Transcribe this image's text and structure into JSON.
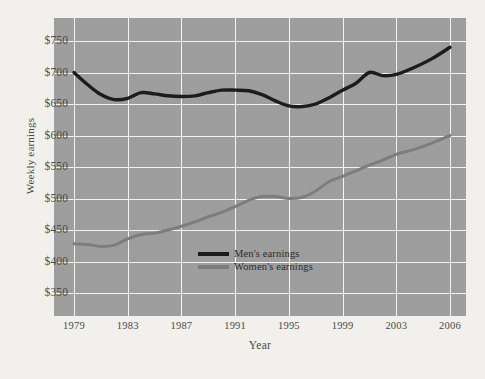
{
  "chart_data": {
    "type": "line",
    "title": "",
    "xlabel": "Year",
    "ylabel": "Weekly earnings",
    "xlim": [
      1979,
      2006
    ],
    "ylim": [
      350,
      750
    ],
    "ytick_labels": [
      "$750",
      "$700",
      "$650",
      "$600",
      "$550",
      "$500",
      "$450",
      "$400",
      "$350"
    ],
    "ytick_values": [
      750,
      700,
      650,
      600,
      550,
      500,
      450,
      400,
      350
    ],
    "xtick_labels": [
      "1979",
      "1983",
      "1987",
      "1991",
      "1995",
      "1999",
      "2003",
      "2006"
    ],
    "xtick_values": [
      1979,
      1983,
      1987,
      1991,
      1995,
      1999,
      2003,
      2006
    ],
    "grid": true,
    "legend_position": "center-left-inside",
    "plot_background": "#9b9b9b",
    "gridline_color": "#f4f3f0",
    "page_background": "#f1f0ed",
    "series": [
      {
        "name": "Men's earnings",
        "color": "#1c1c1a",
        "x": [
          1979,
          1980,
          1981,
          1982,
          1983,
          1984,
          1985,
          1986,
          1987,
          1988,
          1989,
          1990,
          1991,
          1992,
          1993,
          1994,
          1995,
          1996,
          1997,
          1998,
          1999,
          2000,
          2001,
          2002,
          2003,
          2004,
          2005,
          2006
        ],
        "values": [
          700,
          681,
          665,
          657,
          659,
          668,
          666,
          663,
          662,
          663,
          668,
          672,
          672,
          671,
          665,
          655,
          647,
          646,
          650,
          660,
          672,
          683,
          700,
          695,
          697,
          708,
          722,
          740
        ]
      },
      {
        "name": "Women's earnings",
        "color": "#7d7d7b",
        "x": [
          1979,
          1980,
          1981,
          1982,
          1983,
          1984,
          1985,
          1986,
          1987,
          1988,
          1989,
          1990,
          1991,
          1992,
          1993,
          1994,
          1995,
          1996,
          1997,
          1998,
          1999,
          2000,
          2001,
          2002,
          2003,
          2004,
          2005,
          2006
        ],
        "values": [
          428,
          427,
          424,
          426,
          436,
          443,
          445,
          450,
          456,
          463,
          471,
          478,
          487,
          497,
          503,
          503,
          500,
          502,
          512,
          527,
          535,
          544,
          553,
          561,
          570,
          578,
          588,
          600
        ]
      }
    ]
  },
  "legend": {
    "entries": [
      {
        "label": "Men's earnings",
        "color": "#1c1c1a"
      },
      {
        "label": "Women's earnings",
        "color": "#7d7d7b"
      }
    ]
  }
}
